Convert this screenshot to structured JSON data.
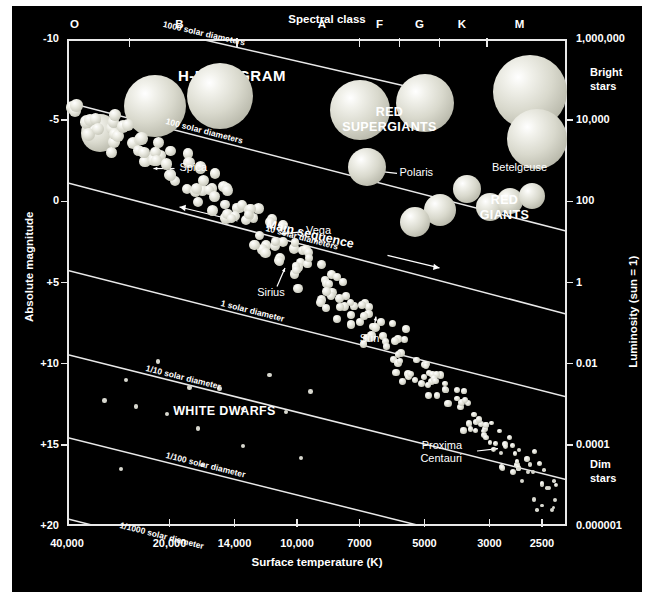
{
  "chart_data": {
    "type": "scatter",
    "title": "H-R DIAGRAM",
    "xlabel": "Surface temperature (K)",
    "ylabel": "Absolute magnitude",
    "x_top_label": "Spectral class",
    "y_right_label": "Luminosity (sun = 1)",
    "xlim": [
      40000,
      2500
    ],
    "ylim": [
      -10,
      20
    ],
    "grid": false,
    "legend": "none",
    "x_ticks": [
      "40,000",
      "20,000",
      "14,000",
      "10,000",
      "7000",
      "5000",
      "3000",
      "2500"
    ],
    "x_tick_fracs": [
      0.0,
      0.205,
      0.335,
      0.46,
      0.585,
      0.715,
      0.845,
      0.95
    ],
    "y_ticks": [
      "-10",
      "-5",
      "0",
      "+5",
      "+10",
      "+15",
      "+20"
    ],
    "y_tick_fracs": [
      0.0,
      0.1667,
      0.3333,
      0.5,
      0.6667,
      0.8333,
      1.0
    ],
    "spectral_classes": [
      "O",
      "B",
      "A",
      "F",
      "G",
      "K",
      "M"
    ],
    "spectral_label_fracs": [
      0.015,
      0.225,
      0.51,
      0.625,
      0.705,
      0.79,
      0.905
    ],
    "spectral_boundary_fracs": [
      0.125,
      0.34,
      0.585,
      0.665,
      0.745,
      0.84
    ],
    "luminosity_ticks": [
      "1,000,000",
      "10,000",
      "100",
      "1",
      "0.01",
      "0.0001",
      "0.000001"
    ],
    "luminosity_tick_fracs": [
      0.0,
      0.1667,
      0.3333,
      0.5,
      0.6667,
      0.8333,
      1.0
    ],
    "bright_label": "Bright\nstars",
    "dim_label": "Dim\nstars",
    "regions": [
      {
        "name": "RED SUPERGIANTS",
        "x_frac": 0.645,
        "y_frac": 0.155
      },
      {
        "name": "RED GIANTS",
        "x_frac": 0.875,
        "y_frac": 0.335
      },
      {
        "name": "WHITE DWARFS",
        "x_frac": 0.315,
        "y_frac": 0.768
      }
    ],
    "radius_lines": [
      {
        "label": "1000 solar diameters",
        "x1_frac": 0.118,
        "y1_frac": -0.035,
        "x2_frac": 0.7,
        "y2_frac": 0.102
      },
      {
        "label": "100 solar diameters",
        "x1_frac": 0.0,
        "y1_frac": 0.13,
        "x2_frac": 1.0,
        "y2_frac": 0.395
      },
      {
        "label": "10 solar diameters",
        "x1_frac": 0.0,
        "y1_frac": 0.295,
        "x2_frac": 1.0,
        "y2_frac": 0.565
      },
      {
        "label": "1 solar diameter",
        "x1_frac": 0.0,
        "y1_frac": 0.475,
        "x2_frac": 1.0,
        "y2_frac": 0.735
      },
      {
        "label": "1/10 solar diameter",
        "x1_frac": 0.0,
        "y1_frac": 0.648,
        "x2_frac": 1.0,
        "y2_frac": 0.905
      },
      {
        "label": "1/100 solar diameter",
        "x1_frac": 0.0,
        "y1_frac": 0.818,
        "x2_frac": 1.0,
        "y2_frac": 1.075
      },
      {
        "label": "1/1000 solar diameter",
        "x1_frac": 0.0,
        "y1_frac": 0.985,
        "x2_frac": 0.63,
        "y2_frac": 1.15
      }
    ],
    "main_sequence_arrow_label": "Main sequence",
    "named_stars": [
      {
        "name": "Spica",
        "x_frac": 0.155,
        "y_frac": 0.265
      },
      {
        "name": "Polaris",
        "x_frac": 0.6,
        "y_frac": 0.275
      },
      {
        "name": "Betelgeuse",
        "x_frac": 0.905,
        "y_frac": 0.215
      },
      {
        "name": "Vega",
        "x_frac": 0.41,
        "y_frac": 0.395
      },
      {
        "name": "Sirius",
        "x_frac": 0.4,
        "y_frac": 0.465
      },
      {
        "name": "Sun",
        "x_frac": 0.607,
        "y_frac": 0.565
      },
      {
        "name": "Proxima Centauri",
        "x_frac": 0.865,
        "y_frac": 0.843
      }
    ],
    "supergiant_spheres": [
      {
        "x_frac": 0.065,
        "y_frac": 0.193,
        "r": 19
      },
      {
        "x_frac": 0.175,
        "y_frac": 0.138,
        "r": 31
      },
      {
        "x_frac": 0.305,
        "y_frac": 0.118,
        "r": 33
      },
      {
        "x_frac": 0.585,
        "y_frac": 0.145,
        "r": 30
      },
      {
        "x_frac": 0.715,
        "y_frac": 0.132,
        "r": 29
      },
      {
        "x_frac": 0.925,
        "y_frac": 0.108,
        "r": 37
      },
      {
        "x_frac": 0.94,
        "y_frac": 0.205,
        "r": 30
      },
      {
        "x_frac": 0.6,
        "y_frac": 0.262,
        "r": 19
      }
    ],
    "giant_spheres": [
      {
        "x_frac": 0.745,
        "y_frac": 0.352,
        "r": 16
      },
      {
        "x_frac": 0.8,
        "y_frac": 0.307,
        "r": 14
      },
      {
        "x_frac": 0.845,
        "y_frac": 0.345,
        "r": 14
      },
      {
        "x_frac": 0.885,
        "y_frac": 0.332,
        "r": 13
      },
      {
        "x_frac": 0.93,
        "y_frac": 0.322,
        "r": 13
      },
      {
        "x_frac": 0.695,
        "y_frac": 0.375,
        "r": 15
      }
    ]
  },
  "figure": {
    "background": "#000000",
    "line_color": "#e9e9e9",
    "star_color": "#d7d7c8"
  }
}
